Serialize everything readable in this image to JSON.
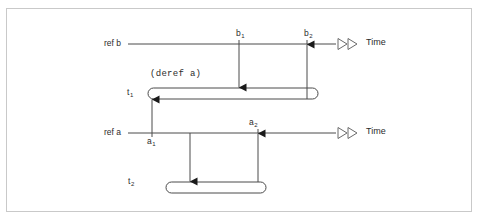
{
  "diagram": {
    "background_color": "#ffffff",
    "frame_color": "#c9c9c9",
    "line_color": "#4a4a4a",
    "text_color": "#2b2b2b",
    "timelines": [
      {
        "id": "ref-b",
        "label": "ref b",
        "axis_label": "Time",
        "y": 44,
        "x_start": 128,
        "x_end": 336
      },
      {
        "id": "ref-a",
        "label": "ref a",
        "axis_label": "Time",
        "y": 133,
        "x_start": 128,
        "x_end": 336
      }
    ],
    "events": [
      {
        "id": "b1",
        "label": "b",
        "subscript": "1",
        "timeline": "ref-b",
        "x": 239,
        "position": "above"
      },
      {
        "id": "b2",
        "label": "b",
        "subscript": "2",
        "timeline": "ref-b",
        "x": 307,
        "position": "above"
      },
      {
        "id": "a1",
        "label": "a",
        "subscript": "1",
        "timeline": "ref-a",
        "x": 152,
        "position": "below"
      },
      {
        "id": "a2",
        "label": "a",
        "subscript": "2",
        "timeline": "ref-a",
        "x": 258,
        "position": "above"
      }
    ],
    "transactions": [
      {
        "id": "t1",
        "label": "t",
        "subscript": "1",
        "annotation": "(deref a)",
        "x_start": 148,
        "x_end": 318,
        "y": 93
      },
      {
        "id": "t2",
        "label": "t",
        "subscript": "2",
        "annotation": "",
        "x_start": 166,
        "x_end": 266,
        "y": 187
      }
    ],
    "arrows": [
      {
        "id": "b1-to-t1",
        "from": "b1",
        "to": "t1",
        "direction": "down",
        "x": 239,
        "y_from": 44,
        "y_to": 88
      },
      {
        "id": "t1-to-b2",
        "from": "t1",
        "to": "b2",
        "direction": "up",
        "x": 307,
        "y_from": 98,
        "y_to": 45
      },
      {
        "id": "a1-to-t1",
        "from": "a1",
        "to": "t1",
        "direction": "up",
        "x": 152,
        "y_from": 133,
        "y_to": 99
      },
      {
        "id": "a1-to-t2",
        "from": "a1",
        "to": "t2",
        "direction": "down",
        "x": 190,
        "y_from": 133,
        "y_to": 182
      },
      {
        "id": "t2-to-a2",
        "from": "t2",
        "to": "a2",
        "direction": "up",
        "x": 258,
        "y_from": 182,
        "y_to": 134
      }
    ]
  }
}
